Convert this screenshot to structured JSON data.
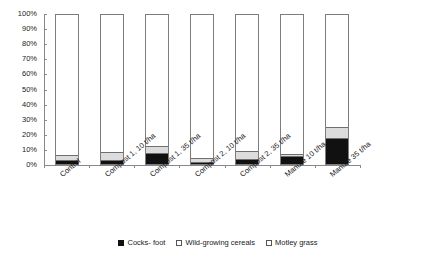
{
  "chart_data": {
    "type": "bar",
    "stacked": true,
    "stack_total": 100,
    "title": "",
    "subtitle": "",
    "xlabel": "",
    "ylabel": "",
    "ylim": [
      0,
      100
    ],
    "grid": false,
    "legend_position": "bottom",
    "unit": "%",
    "categories": [
      "Control",
      "Compost 1, 10 t/ha",
      "Compost 1, 35 t/ha",
      "Compost 2, 10 t/ha",
      "Compost 2, 35 t/ha",
      "Manure 10 t/ha",
      "Manure 35 t/ha"
    ],
    "ytick_labels": [
      "100%",
      "90%",
      "80%",
      "70%",
      "60%",
      "50%",
      "40%",
      "30%",
      "20%",
      "10%",
      "0%"
    ],
    "ytick_values": [
      100,
      90,
      80,
      70,
      60,
      50,
      40,
      30,
      20,
      10,
      0
    ],
    "series": [
      {
        "name": "Cocks- foot",
        "color": "#111111",
        "values": [
          2,
          2,
          7,
          1,
          3,
          5,
          17
        ]
      },
      {
        "name": "Wild-growing cereals",
        "color": "#dcdcdc",
        "values": [
          4,
          6,
          5,
          3,
          6,
          2,
          8
        ]
      },
      {
        "name": "Motley grass",
        "color": "#ffffff",
        "values": [
          94,
          92,
          88,
          96,
          91,
          93,
          75
        ]
      }
    ]
  }
}
